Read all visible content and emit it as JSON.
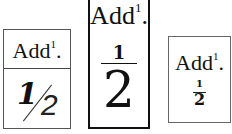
{
  "labels": [
    {
      "abbrev": "Add",
      "superscript": "1",
      "dot": ".",
      "numerator": "1",
      "separator": "/",
      "denominator": "2",
      "style": "slashed"
    },
    {
      "abbrev": "Add",
      "superscript": "1",
      "dot": ".",
      "numerator": "1",
      "denominator": "2",
      "style": "stacked-large"
    },
    {
      "abbrev": "Add",
      "superscript": "1",
      "dot": ".",
      "numerator": "1",
      "denominator": "2",
      "style": "stacked-small"
    }
  ]
}
